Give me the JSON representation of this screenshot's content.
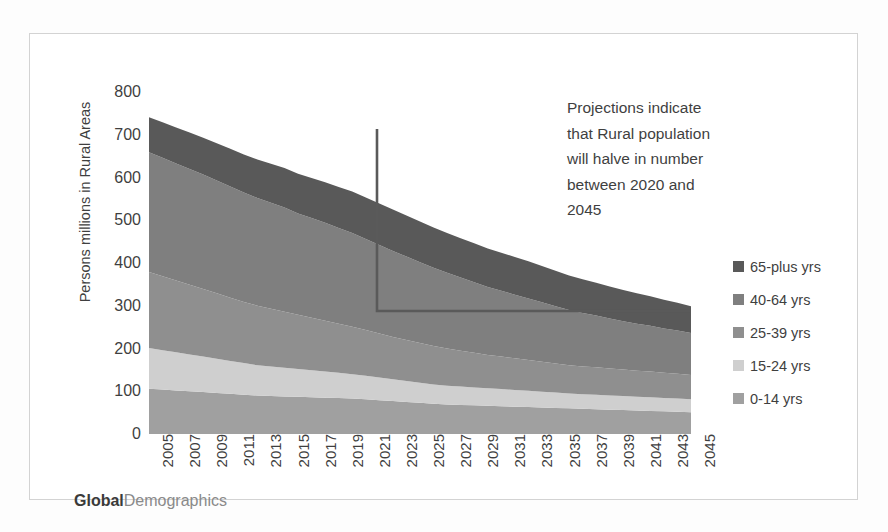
{
  "chart_data": {
    "type": "area",
    "stacked": true,
    "title": "",
    "xlabel": "",
    "ylabel": "Persons millions in Rural Areas",
    "ylim": [
      0,
      800
    ],
    "ytick_values": [
      800,
      700,
      600,
      500,
      400,
      300,
      200,
      100,
      0
    ],
    "ytick_labels": [
      "800",
      "700",
      "600",
      "500",
      "400",
      "300",
      "200",
      "100",
      "0"
    ],
    "grid": false,
    "legend_position": "right",
    "x": [
      2005,
      2006,
      2007,
      2008,
      2009,
      2010,
      2011,
      2012,
      2013,
      2014,
      2015,
      2016,
      2017,
      2018,
      2019,
      2020,
      2021,
      2022,
      2023,
      2024,
      2025,
      2026,
      2027,
      2028,
      2029,
      2030,
      2031,
      2032,
      2033,
      2034,
      2035,
      2036,
      2037,
      2038,
      2039,
      2040,
      2041,
      2042,
      2043,
      2044,
      2045
    ],
    "xtick_labels": [
      "2005",
      "2007",
      "2009",
      "2011",
      "2013",
      "2015",
      "2017",
      "2019",
      "2021",
      "2023",
      "2025",
      "2027",
      "2029",
      "2031",
      "2033",
      "2035",
      "2037",
      "2039",
      "2041",
      "2043",
      "2045"
    ],
    "series": [
      {
        "name": "0-14 yrs",
        "color": "#a0a0a0",
        "values": [
          106,
          104,
          102,
          100,
          98,
          96,
          94,
          92,
          90,
          89,
          88,
          87,
          86,
          85,
          84,
          83,
          81,
          79,
          77,
          75,
          73,
          71,
          69,
          68,
          67,
          66,
          65,
          64,
          63,
          62,
          61,
          60,
          59,
          58,
          57,
          56,
          55,
          54,
          53,
          52,
          51
        ]
      },
      {
        "name": "15-24 yrs",
        "color": "#cfcfcf",
        "values": [
          95,
          92,
          89,
          86,
          83,
          80,
          77,
          74,
          71,
          69,
          67,
          65,
          63,
          61,
          59,
          57,
          55,
          53,
          51,
          49,
          47,
          45,
          44,
          43,
          42,
          41,
          40,
          39,
          38,
          37,
          36,
          35,
          34,
          34,
          33,
          33,
          32,
          32,
          31,
          31,
          30
        ]
      },
      {
        "name": "25-39 yrs",
        "color": "#8f8f8f",
        "values": [
          178,
          173,
          168,
          163,
          158,
          153,
          148,
          143,
          139,
          135,
          131,
          127,
          123,
          119,
          115,
          111,
          107,
          103,
          99,
          96,
          93,
          90,
          87,
          84,
          81,
          78,
          76,
          74,
          72,
          70,
          68,
          66,
          65,
          64,
          63,
          62,
          61,
          60,
          59,
          58,
          57
        ]
      },
      {
        "name": "40-64 yrs",
        "color": "#7f7f7f",
        "values": [
          280,
          277,
          274,
          271,
          268,
          264,
          260,
          256,
          252,
          248,
          244,
          237,
          233,
          229,
          224,
          219,
          213,
          207,
          201,
          195,
          189,
          183,
          177,
          171,
          165,
          159,
          154,
          149,
          144,
          139,
          134,
          129,
          125,
          121,
          117,
          113,
          110,
          107,
          104,
          101,
          98
        ]
      },
      {
        "name": "65-plus yrs",
        "color": "#595959",
        "values": [
          82,
          83,
          84,
          85,
          86,
          87,
          88,
          89,
          90,
          91,
          92,
          93,
          94,
          95,
          96,
          97,
          97,
          97,
          97,
          96,
          95,
          94,
          93,
          92,
          91,
          90,
          89,
          88,
          87,
          85,
          83,
          81,
          79,
          77,
          75,
          73,
          71,
          69,
          67,
          65,
          63
        ]
      }
    ],
    "legend_entries": [
      {
        "label": "65-plus yrs",
        "color": "#595959"
      },
      {
        "label": "40-64 yrs",
        "color": "#7f7f7f"
      },
      {
        "label": "25-39 yrs",
        "color": "#8f8f8f"
      },
      {
        "label": "15-24 yrs",
        "color": "#cfcfcf"
      },
      {
        "label": "0-14 yrs",
        "color": "#a0a0a0"
      }
    ],
    "annotations": [
      {
        "text": "Projections indicate that Rural population will halve in number between 2020 and 2045",
        "lines": [
          "Projections indicate",
          "that Rural population",
          "will halve in number",
          "between 2020 and",
          "2045"
        ],
        "callout_color": "#5a5a5a",
        "callout_from_year": 2021,
        "callout_to_year": 2045
      }
    ]
  },
  "brand": {
    "strong": "Global",
    "light": "Demographics"
  },
  "colors": {
    "frame": "#d3d3d3",
    "text": "#3f3f3f",
    "callout": "#5a5a5a"
  }
}
